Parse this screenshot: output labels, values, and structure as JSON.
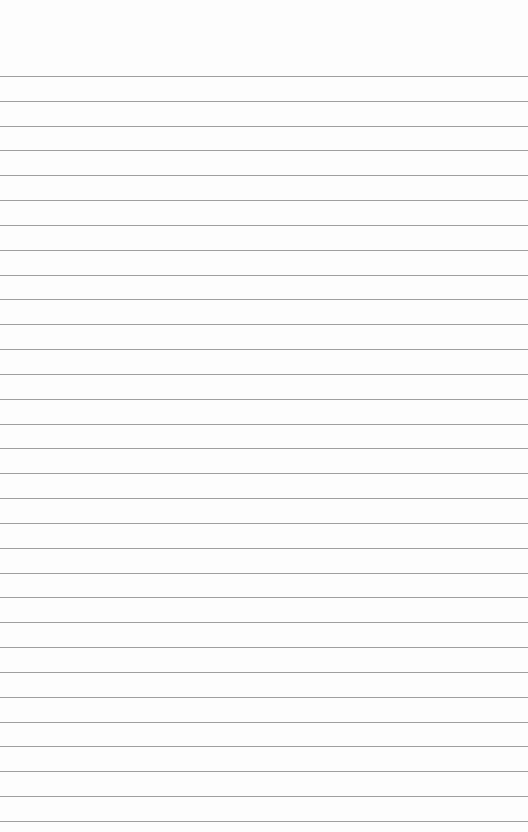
{
  "page": {
    "type": "lined-paper",
    "background_color": "#fdfdfd",
    "line_color": "#8e8e8e",
    "first_line_y": 76,
    "line_spacing": 24.83,
    "line_count": 31
  }
}
